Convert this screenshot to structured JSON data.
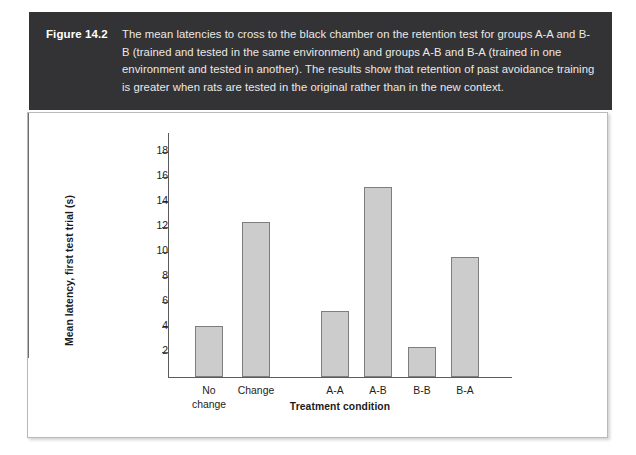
{
  "figure": {
    "number": "Figure 14.2",
    "caption": "The mean latencies to cross to the black chamber on the retention test for groups A-A and B-B (trained and tested in the same environment) and groups A-B and B-A (trained in one environment and tested in another). The results show that retention of past avoidance training is greater when rats are tested in the original rather than in the new context."
  },
  "colors": {
    "caption_band": "#333234",
    "caption_text": "#ebe9e6",
    "panel_background": "#ffffff",
    "bar_fill": "#cccccc",
    "bar_border": "#7e7e7e",
    "axis": "#5b5b5b"
  },
  "chart_data": {
    "type": "bar",
    "title": "",
    "xlabel": "Treatment condition",
    "ylabel": "Mean latency, first test trial (s)",
    "categories": [
      "No\nchange",
      "Change",
      "A-A",
      "A-B",
      "B-B",
      "B-A"
    ],
    "values": [
      4.1,
      12.4,
      5.3,
      15.2,
      2.4,
      9.6
    ],
    "ylim": [
      0,
      19.5
    ],
    "yticks": [
      2,
      4,
      6,
      8,
      10,
      12,
      14,
      16,
      18
    ],
    "ytick_labels": [
      "2",
      "4",
      "6",
      "8",
      "10",
      "12",
      "14",
      "16",
      "18"
    ],
    "grid": false,
    "legend": "none",
    "groups": [
      {
        "name": "left",
        "categories": [
          "No\nchange",
          "Change"
        ]
      },
      {
        "name": "right",
        "categories": [
          "A-A",
          "A-B",
          "B-B",
          "B-A"
        ]
      }
    ],
    "group_divider": true
  }
}
